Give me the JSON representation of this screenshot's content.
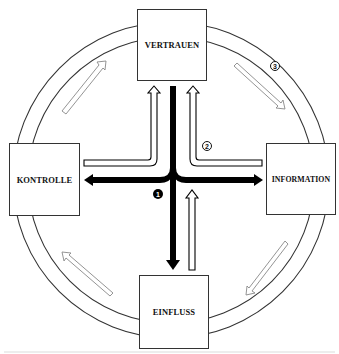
{
  "diagram": {
    "nodes": {
      "top": {
        "label": "VERTRAUEN"
      },
      "left": {
        "label": "KONTROLLE"
      },
      "right": {
        "label": "INFORMATION"
      },
      "bottom": {
        "label": "EINFLUSS"
      }
    },
    "markers": {
      "one": "1",
      "two": "2",
      "three": "3"
    },
    "colors": {
      "line": "#333333",
      "solid_arrow": "#000000",
      "ring_arrow": "#888888",
      "background": "#ffffff"
    },
    "edges": [
      {
        "type": "solid",
        "from": "VERTRAUEN",
        "to": "EINFLUSS",
        "marker": "1"
      },
      {
        "type": "solid",
        "from": "center",
        "to": "KONTROLLE",
        "marker": "1"
      },
      {
        "type": "solid",
        "from": "center",
        "to": "INFORMATION",
        "marker": "1"
      },
      {
        "type": "hollow",
        "from": "KONTROLLE",
        "to": "VERTRAUEN",
        "marker": "2"
      },
      {
        "type": "hollow",
        "from": "INFORMATION",
        "to": "VERTRAUEN",
        "marker": "2"
      },
      {
        "type": "hollow",
        "from": "EINFLUSS",
        "to": "center",
        "marker": "2"
      },
      {
        "type": "ring",
        "direction": "clockwise",
        "marker": "3"
      }
    ]
  }
}
